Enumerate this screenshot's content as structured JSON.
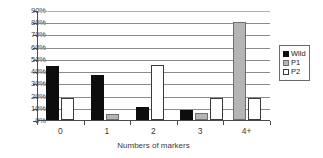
{
  "chart_data": {
    "type": "bar",
    "title": "",
    "xlabel": "Numbers of markers",
    "ylabel": "",
    "categories": [
      "0",
      "1",
      "2",
      "3",
      "4+"
    ],
    "series": [
      {
        "name": "Wild",
        "color": "#0d0d0d",
        "values": [
          44,
          37,
          10.5,
          8,
          0
        ]
      },
      {
        "name": "P1",
        "color": "#b5b5b5",
        "values": [
          0,
          5,
          0,
          5.5,
          80
        ]
      },
      {
        "name": "P2",
        "color": "#ffffff",
        "values": [
          18,
          0,
          45,
          18,
          18
        ]
      }
    ],
    "ylim": [
      0,
      90
    ],
    "ytick_labels": [
      "90%",
      "80%",
      "70%",
      "60%",
      "50%",
      "40%",
      "30%",
      "20%",
      "10%",
      "0%"
    ],
    "ytick_values": [
      90,
      80,
      70,
      60,
      50,
      40,
      30,
      20,
      10,
      0
    ],
    "grid": true,
    "grid_axis": "y",
    "legend_position": "right",
    "value_suffix": "%"
  },
  "legend": {
    "items": [
      {
        "label": "Wild",
        "swatch": "black-square-swatch"
      },
      {
        "label": "P1",
        "swatch": "gray-square-swatch"
      },
      {
        "label": "P2",
        "swatch": "white-square-swatch"
      }
    ]
  }
}
